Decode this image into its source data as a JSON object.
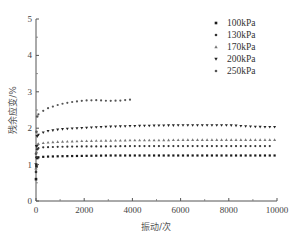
{
  "chart_data": {
    "type": "scatter",
    "title": "",
    "xlabel": "振动/次",
    "ylabel": "残余应变/%",
    "xlim": [
      0,
      10000
    ],
    "ylim": [
      0,
      5
    ],
    "xticks": [
      0,
      2000,
      4000,
      6000,
      8000,
      10000
    ],
    "yticks": [
      0,
      1,
      2,
      3,
      4,
      5
    ],
    "grid": false,
    "legend_position": "upper right",
    "series": [
      {
        "name": "100kPa",
        "marker": "square",
        "x": [
          0,
          20,
          50,
          100,
          200,
          500,
          1000,
          2000,
          3000,
          4000,
          5000,
          6000,
          7000,
          8000,
          9000,
          10000
        ],
        "values": [
          0.6,
          0.95,
          1.18,
          1.2,
          1.21,
          1.22,
          1.23,
          1.24,
          1.25,
          1.25,
          1.25,
          1.25,
          1.25,
          1.25,
          1.25,
          1.25
        ]
      },
      {
        "name": "130kPa",
        "marker": "circle",
        "x": [
          0,
          20,
          50,
          100,
          200,
          500,
          1000,
          2000,
          3000,
          4000,
          5000,
          6000,
          7000,
          8000,
          9000,
          9800
        ],
        "values": [
          0.8,
          1.2,
          1.42,
          1.45,
          1.47,
          1.48,
          1.49,
          1.5,
          1.5,
          1.51,
          1.51,
          1.51,
          1.51,
          1.51,
          1.51,
          1.51
        ]
      },
      {
        "name": "170kPa",
        "marker": "triangle-up",
        "x": [
          0,
          20,
          50,
          100,
          200,
          500,
          1000,
          2000,
          3000,
          4000,
          5000,
          6000,
          7000,
          8000,
          9000,
          10000
        ],
        "values": [
          0.9,
          1.35,
          1.55,
          1.57,
          1.59,
          1.61,
          1.63,
          1.65,
          1.66,
          1.67,
          1.67,
          1.68,
          1.68,
          1.68,
          1.68,
          1.68
        ]
      },
      {
        "name": "200kPa",
        "marker": "triangle-down",
        "x": [
          0,
          20,
          50,
          100,
          200,
          500,
          1000,
          2000,
          3000,
          4000,
          5000,
          6000,
          7000,
          8000,
          8500,
          9000,
          9500,
          10000
        ],
        "values": [
          1.0,
          1.5,
          1.78,
          1.82,
          1.86,
          1.92,
          1.97,
          2.01,
          2.04,
          2.06,
          2.07,
          2.08,
          2.08,
          2.08,
          2.06,
          2.04,
          2.03,
          2.03
        ]
      },
      {
        "name": "250kPa",
        "marker": "circle",
        "x": [
          0,
          20,
          50,
          100,
          200,
          500,
          1000,
          1500,
          2000,
          2500,
          3000,
          3500,
          4000
        ],
        "values": [
          1.3,
          1.9,
          2.32,
          2.38,
          2.44,
          2.55,
          2.66,
          2.72,
          2.76,
          2.77,
          2.75,
          2.76,
          2.79
        ]
      }
    ]
  }
}
